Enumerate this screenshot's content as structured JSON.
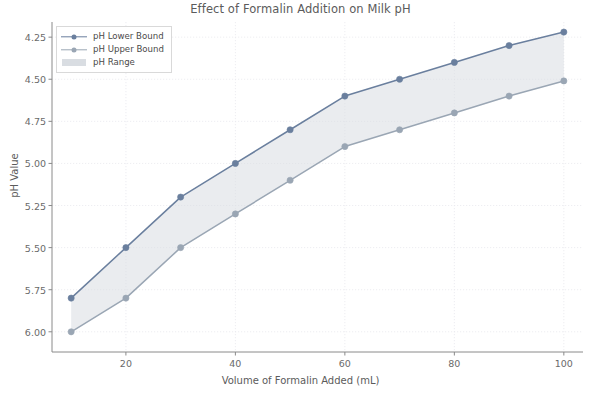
{
  "chart_data": {
    "type": "line",
    "title": "Effect of Formalin Addition on Milk pH",
    "xlabel": "Volume of Formalin Added (mL)",
    "ylabel": "pH Value",
    "x": [
      10,
      20,
      30,
      40,
      50,
      60,
      70,
      80,
      90,
      100
    ],
    "series": [
      {
        "name": "pH Lower Bound",
        "values": [
          5.8,
          5.5,
          5.2,
          5.0,
          4.8,
          4.6,
          4.5,
          4.4,
          4.3,
          4.22
        ],
        "color": "#6a7f9e",
        "marker": "circle"
      },
      {
        "name": "pH Upper Bound",
        "values": [
          6.0,
          5.8,
          5.5,
          5.3,
          5.1,
          4.9,
          4.8,
          4.7,
          4.6,
          4.51
        ],
        "color": "#9aa6b4",
        "marker": "circle"
      }
    ],
    "fill_between": {
      "name": "pH Range",
      "color": "#d9dde2",
      "lower_series": "pH Lower Bound",
      "upper_series": "pH Upper Bound"
    },
    "xlim": [
      6.5,
      103.5
    ],
    "ylim": [
      6.12,
      4.16
    ],
    "y_inverted": true,
    "xticks": [
      20,
      40,
      60,
      80,
      100
    ],
    "xtick_labels": [
      "20",
      "40",
      "60",
      "80",
      "100"
    ],
    "yticks": [
      4.25,
      4.5,
      4.75,
      5.0,
      5.25,
      5.5,
      5.75,
      6.0
    ],
    "ytick_labels": [
      "4.25",
      "4.50",
      "4.75",
      "5.00",
      "5.25",
      "5.50",
      "5.75",
      "6.00"
    ],
    "grid": true,
    "grid_color": "#e8e8ee",
    "legend_position": "upper left",
    "legend_entries": [
      "pH Lower Bound",
      "pH Upper Bound",
      "pH Range"
    ],
    "axes_color": "#8a8a8a",
    "background": "#ffffff"
  }
}
